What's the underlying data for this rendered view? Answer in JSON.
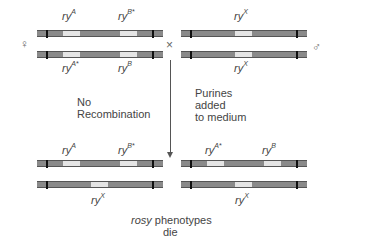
{
  "parents": {
    "female_symbol": "♀",
    "male_symbol": "♂",
    "cross_symbol": "×",
    "female": {
      "top": {
        "labels": [
          {
            "base": "ry",
            "sup": "A"
          },
          {
            "base": "ry",
            "sup": "B*"
          }
        ]
      },
      "bottom": {
        "labels": [
          {
            "base": "ry",
            "sup": "A*"
          },
          {
            "base": "ry",
            "sup": "B"
          }
        ]
      }
    },
    "male": {
      "top": {
        "labels": [
          {
            "base": "ry",
            "sup": "X"
          }
        ]
      },
      "bottom": {
        "labels": [
          {
            "base": "ry",
            "sup": "X"
          }
        ]
      }
    }
  },
  "annotations": {
    "no_recombination": [
      "No",
      "Recombination"
    ],
    "purines": [
      "Purines",
      "added",
      "to medium"
    ]
  },
  "offspring": {
    "left": {
      "top": {
        "labels": [
          {
            "base": "ry",
            "sup": "A"
          },
          {
            "base": "ry",
            "sup": "B*"
          }
        ]
      },
      "bottom": {
        "labels": [
          {
            "base": "ry",
            "sup": "X"
          }
        ]
      }
    },
    "right": {
      "top": {
        "labels": [
          {
            "base": "ry",
            "sup": "A*"
          },
          {
            "base": "ry",
            "sup": "B"
          }
        ]
      },
      "bottom": {
        "labels": [
          {
            "base": "ry",
            "sup": "X"
          }
        ]
      }
    }
  },
  "result": {
    "italic": "rosy",
    "rest": " phenotypes",
    "line2": "die"
  },
  "colors": {
    "chromosome": "#8a8a8a",
    "band": "#e4e4e4",
    "centromere": "#111111",
    "text": "#444444"
  }
}
